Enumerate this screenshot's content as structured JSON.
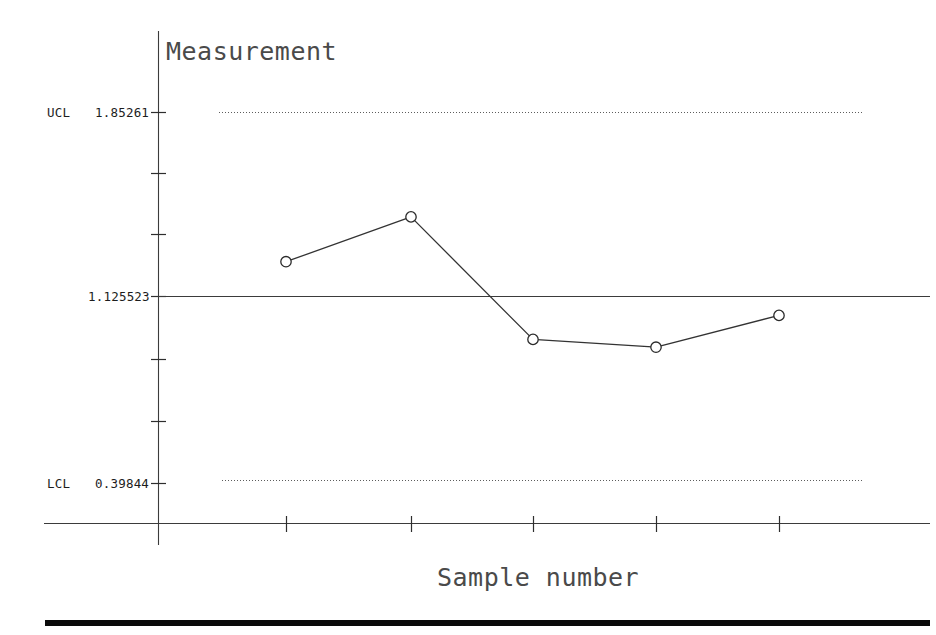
{
  "chart_data": {
    "type": "line",
    "title": "",
    "ylabel": "Measurement",
    "xlabel": "Sample number",
    "categories": [
      "1",
      "2",
      "3",
      "4",
      "5"
    ],
    "x": [
      1,
      2,
      3,
      4,
      5
    ],
    "values": [
      1.263,
      1.44,
      0.956,
      0.925,
      1.051
    ],
    "series": [
      {
        "name": "Measurement",
        "values": [
          1.263,
          1.44,
          0.956,
          0.925,
          1.051
        ]
      }
    ],
    "control_limits": {
      "ucl_label": "UCL",
      "ucl_value": "1.85261",
      "center_value": "1.125523",
      "lcl_label": "LCL",
      "lcl_value": "0.39844"
    },
    "y_tick_labels": [
      "1.85261",
      "",
      "",
      "1.125523",
      "",
      "",
      "0.39844"
    ],
    "ylim": [
      0.15,
      2.1
    ],
    "xlim": [
      0.45,
      5.6
    ],
    "grid": false,
    "legend": "none",
    "marker": "open-circle",
    "line_style": "solid",
    "limit_line_style": "dotted"
  },
  "labels": {
    "y_axis_title": "Measurement",
    "x_axis_title": "Sample number",
    "ucl_tag": "UCL",
    "ucl_number": "1.85261",
    "center_number": "1.125523",
    "lcl_tag": "LCL",
    "lcl_number": "0.39844"
  },
  "colors": {
    "background": "#ffffff",
    "axis": "#3b3b3b",
    "series": "#333333",
    "limit": "#5d5d5d",
    "text": "#1d1d1d",
    "title_text": "#4a4a4a",
    "footer_rule": "#0a0a0a"
  }
}
